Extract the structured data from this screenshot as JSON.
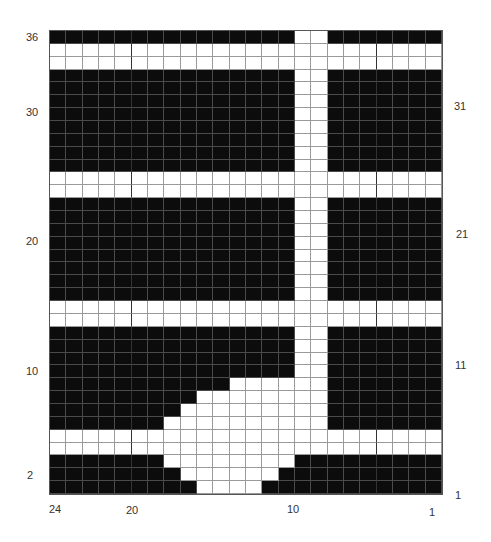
{
  "chart": {
    "columns": 24,
    "rows": 36,
    "colors": {
      "dark": "#0c0c0c",
      "light": "#ffffff",
      "grid": "#9a9a9a"
    },
    "bold_column_boundaries_after_index": [
      4,
      19
    ],
    "row_white_runs": {
      "36": [
        [
          15,
          16
        ]
      ],
      "35": [
        [
          0,
          23
        ]
      ],
      "34": [
        [
          0,
          23
        ]
      ],
      "33": [
        [
          15,
          16
        ]
      ],
      "32": [
        [
          15,
          16
        ]
      ],
      "31": [
        [
          15,
          16
        ]
      ],
      "30": [
        [
          15,
          16
        ]
      ],
      "29": [
        [
          15,
          16
        ]
      ],
      "28": [
        [
          15,
          16
        ]
      ],
      "27": [
        [
          15,
          16
        ]
      ],
      "26": [
        [
          15,
          16
        ]
      ],
      "25": [
        [
          0,
          23
        ]
      ],
      "24": [
        [
          0,
          23
        ]
      ],
      "23": [
        [
          15,
          16
        ]
      ],
      "22": [
        [
          15,
          16
        ]
      ],
      "21": [
        [
          15,
          16
        ]
      ],
      "20": [
        [
          15,
          16
        ]
      ],
      "19": [
        [
          15,
          16
        ]
      ],
      "18": [
        [
          15,
          16
        ]
      ],
      "17": [
        [
          15,
          16
        ]
      ],
      "16": [
        [
          15,
          16
        ]
      ],
      "15": [
        [
          0,
          23
        ]
      ],
      "14": [
        [
          0,
          23
        ]
      ],
      "13": [
        [
          15,
          16
        ]
      ],
      "12": [
        [
          15,
          16
        ]
      ],
      "11": [
        [
          15,
          16
        ]
      ],
      "10": [
        [
          15,
          16
        ]
      ],
      "9": [
        [
          11,
          16
        ]
      ],
      "8": [
        [
          9,
          16
        ]
      ],
      "7": [
        [
          8,
          16
        ]
      ],
      "6": [
        [
          7,
          16
        ]
      ],
      "5": [
        [
          0,
          23
        ]
      ],
      "4": [
        [
          0,
          23
        ]
      ],
      "3": [
        [
          7,
          14
        ]
      ],
      "2": [
        [
          8,
          13
        ]
      ],
      "1": [
        [
          9,
          12
        ]
      ]
    }
  },
  "labels": {
    "left_rows": [
      {
        "text": "36",
        "x": 26,
        "y": 32
      },
      {
        "text": "30",
        "x": 26,
        "y": 107
      },
      {
        "text": "20",
        "x": 26,
        "y": 236
      },
      {
        "text": "10",
        "x": 26,
        "y": 366
      },
      {
        "text": "2",
        "x": 27,
        "y": 470
      }
    ],
    "right_rows": [
      {
        "text": "31",
        "x": 454,
        "y": 101
      },
      {
        "text": "21",
        "x": 456,
        "y": 229
      },
      {
        "text": "11",
        "x": 455,
        "y": 360
      },
      {
        "text": "1",
        "x": 455,
        "y": 490
      }
    ],
    "bottom_columns": [
      {
        "text": "24",
        "x": 49,
        "y": 504
      },
      {
        "text": "20",
        "x": 126,
        "y": 505
      },
      {
        "text": "10",
        "x": 287,
        "y": 504
      },
      {
        "text": "1",
        "x": 429,
        "y": 507
      }
    ]
  }
}
